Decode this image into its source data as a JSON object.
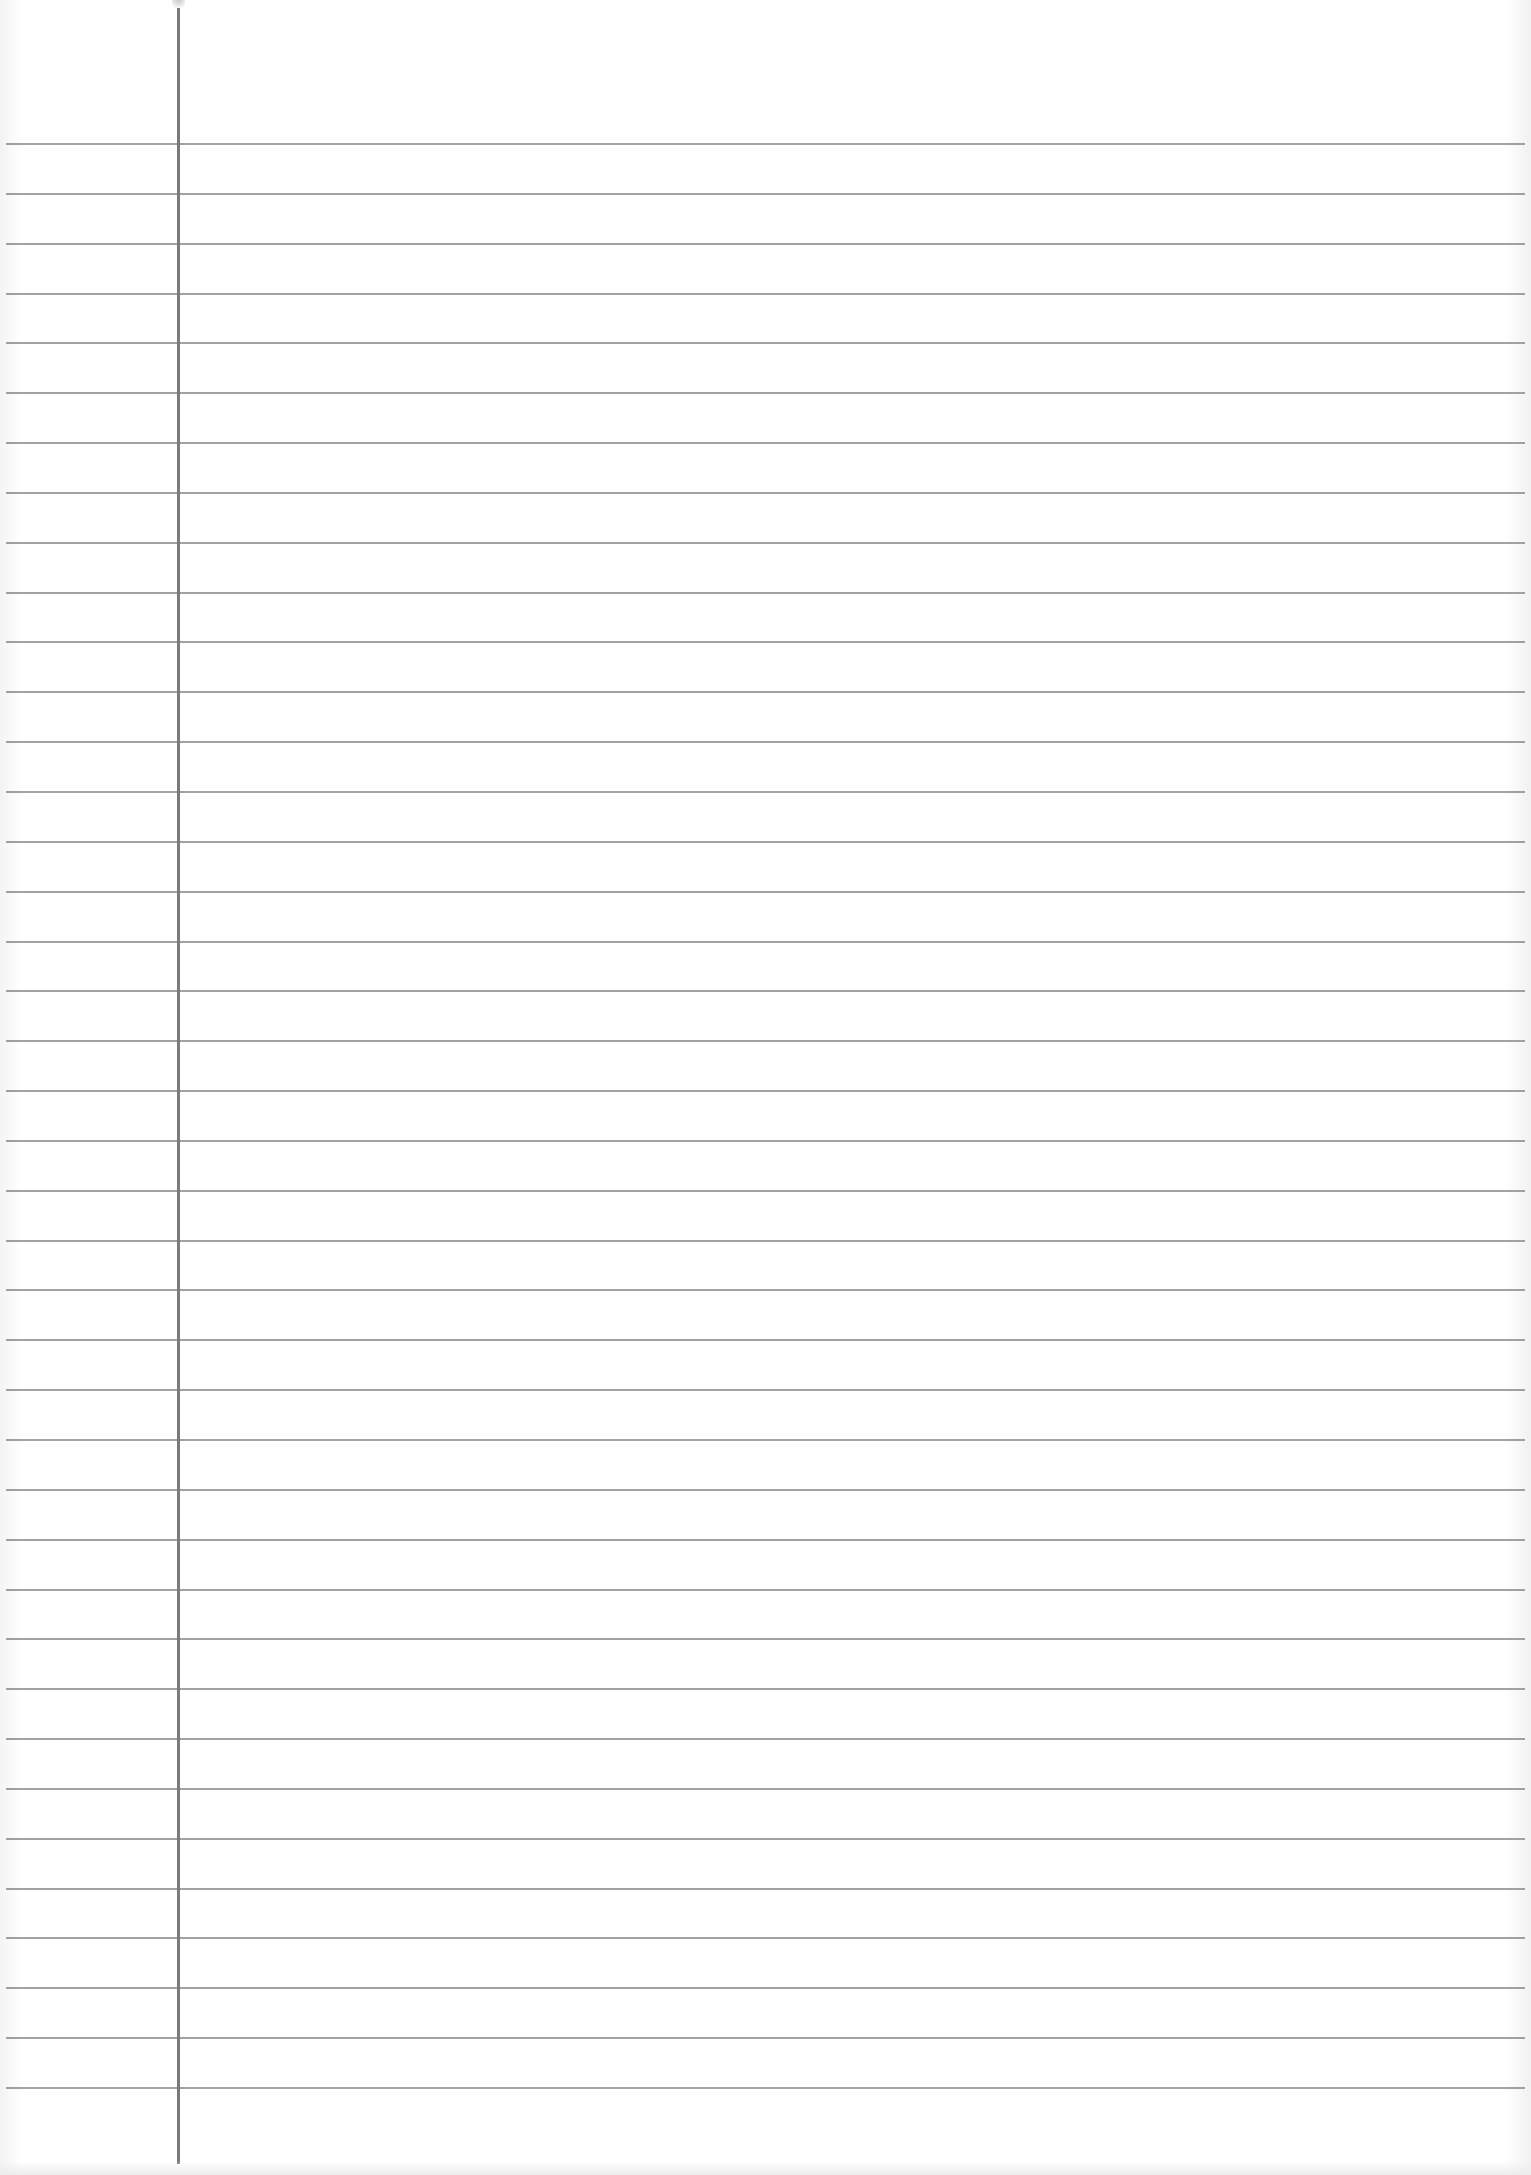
{
  "sheet": {
    "type": "ruled-paper",
    "paper_color": "#fdfdfd",
    "rule_color": "#8a8a8a",
    "margin_color": "#7a7a7a",
    "rule_count": 40,
    "first_rule_y": 143,
    "last_rule_y": 2087,
    "margin_x": 178
  }
}
